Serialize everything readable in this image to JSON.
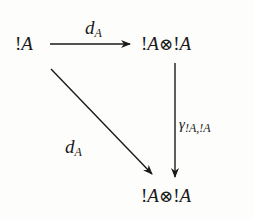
{
  "diagram": {
    "type": "commutative-triangle",
    "nodes": {
      "source": {
        "bang": "!",
        "letter": "A"
      },
      "top_right": {
        "bang1": "!",
        "letter1": "A",
        "op": "⊗",
        "bang2": "!",
        "letter2": "A"
      },
      "bottom_right": {
        "bang1": "!",
        "letter1": "A",
        "op": "⊗",
        "bang2": "!",
        "letter2": "A"
      }
    },
    "arrows": {
      "top": {
        "from": "source",
        "to": "top_right",
        "label_main": "d",
        "label_sub": "A"
      },
      "diagonal": {
        "from": "source",
        "to": "bottom_right",
        "label_main": "d",
        "label_sub": "A"
      },
      "vertical": {
        "from": "top_right",
        "to": "bottom_right",
        "label_main": "γ",
        "label_sub": "!A,!A"
      }
    },
    "colors": {
      "ink": "#1a1a1a",
      "background": "#fdfdfb"
    }
  }
}
